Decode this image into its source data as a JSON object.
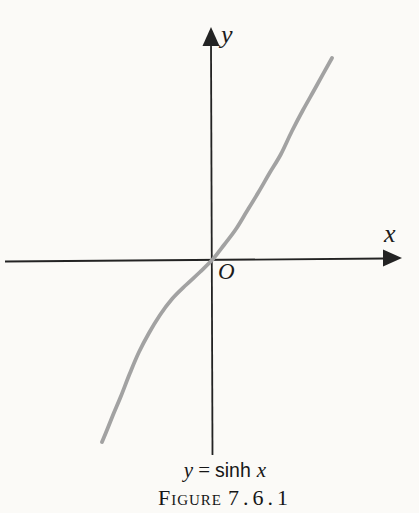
{
  "colors": {
    "page_background": "#fbfaf7",
    "axis": "#232323",
    "text": "#1c1c1c",
    "curve": "#a2a2a2"
  },
  "graph": {
    "y_axis_label": "y",
    "x_axis_label": "x",
    "origin_label": "O"
  },
  "equation": {
    "lhs": "y",
    "relation": "=",
    "function": "sinh",
    "argument": "x"
  },
  "caption": {
    "label": "Figure",
    "number": "7.6.1"
  },
  "chart_data": {
    "type": "line",
    "function": "y = sinh(x)",
    "xlabel": "x",
    "ylabel": "y",
    "origin_label": "O",
    "grid": false,
    "axis_numeric_labels": false,
    "legend": null,
    "axes_px": {
      "origin": [
        212.5,
        259
      ],
      "x_axis": {
        "from": [
          5,
          261.5
        ],
        "to": [
          385,
          258.5
        ],
        "arrow_tip": [
          402,
          258
        ]
      },
      "y_axis": {
        "from": [
          211,
          44
        ],
        "to": [
          212.5,
          455
        ],
        "arrow_tip": [
          211,
          27
        ]
      }
    },
    "series": [
      {
        "name": "y = sinh x",
        "color": "#a2a2a2",
        "stroke_width": 3.8,
        "points_px": [
          [
            102,
            442
          ],
          [
            107,
            430
          ],
          [
            113,
            415
          ],
          [
            121,
            396
          ],
          [
            130,
            373
          ],
          [
            139,
            352
          ],
          [
            149,
            333
          ],
          [
            160,
            315
          ],
          [
            172,
            299
          ],
          [
            186,
            285
          ],
          [
            200,
            272
          ],
          [
            213,
            259
          ],
          [
            224,
            245
          ],
          [
            236,
            229
          ],
          [
            247,
            211
          ],
          [
            258,
            193
          ],
          [
            269,
            174
          ],
          [
            281,
            154
          ],
          [
            292,
            131
          ],
          [
            303,
            110
          ],
          [
            317,
            85
          ],
          [
            332,
            58
          ]
        ]
      }
    ]
  }
}
